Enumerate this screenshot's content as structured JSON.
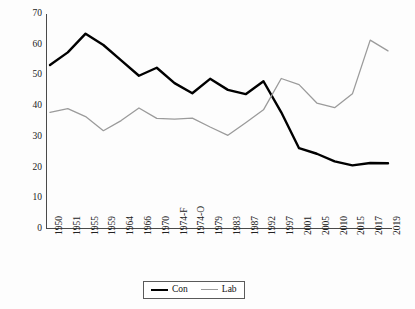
{
  "chart_data": {
    "type": "line",
    "title": "",
    "xlabel": "",
    "ylabel": "Vote share (%)",
    "ylim": [
      0,
      70
    ],
    "yticks": [
      0,
      10,
      20,
      30,
      40,
      50,
      60,
      70
    ],
    "grid": false,
    "legend_position": "bottom-center",
    "categories": [
      "1950",
      "1951",
      "1955",
      "1959",
      "1964",
      "1966",
      "1970",
      "1974-F",
      "1974-O",
      "1979",
      "1983",
      "1987",
      "1992",
      "1997",
      "2001",
      "2005",
      "2010",
      "2015",
      "2017",
      "2019"
    ],
    "series": [
      {
        "name": "Con",
        "color": "#000000",
        "width": 2.4,
        "values": [
          53.4,
          57.5,
          63.6,
          59.9,
          54.9,
          49.9,
          52.5,
          47.5,
          44.2,
          48.9,
          45.3,
          43.9,
          48.1,
          38.0,
          26.3,
          24.5,
          22.0,
          20.7,
          21.5,
          21.4
        ]
      },
      {
        "name": "Lab",
        "color": "#9b9b9b",
        "width": 1.3,
        "values": [
          38.0,
          39.2,
          36.6,
          32.0,
          35.3,
          39.4,
          36.0,
          35.8,
          36.1,
          33.2,
          30.5,
          34.6,
          38.8,
          49.0,
          47.0,
          41.0,
          39.5,
          44.0,
          61.5,
          58.0
        ]
      }
    ]
  },
  "legend": {
    "items": [
      {
        "label": "Con",
        "key": "con"
      },
      {
        "label": "Lab",
        "key": "lab"
      }
    ]
  }
}
